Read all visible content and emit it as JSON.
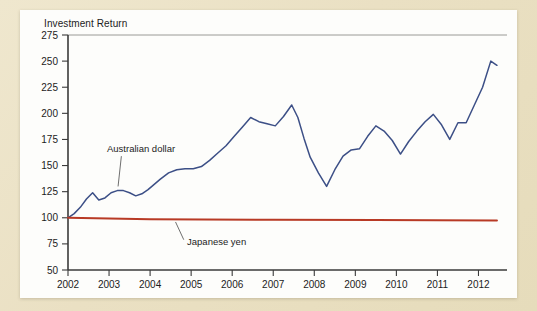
{
  "chart_data": {
    "type": "line",
    "title": "Investment Return",
    "xlabel": "",
    "ylabel": "",
    "xlim": [
      2002,
      2012.5
    ],
    "ylim": [
      50,
      275
    ],
    "grid": false,
    "legend_position": "inline-annotations",
    "y_ticks": [
      275,
      250,
      225,
      200,
      175,
      150,
      125,
      100,
      75,
      50
    ],
    "x_ticks": [
      2002,
      2003,
      2004,
      2005,
      2006,
      2007,
      2008,
      2009,
      2010,
      2011,
      2012
    ],
    "annotations": [
      {
        "text": "Australian dollar",
        "x": 2002.95,
        "y": 163
      },
      {
        "text": "Japanese yen",
        "x": 2004.9,
        "y": 74
      }
    ],
    "series": [
      {
        "name": "Australian dollar",
        "color": "#3c4f86",
        "x": [
          2002.0,
          2002.15,
          2002.3,
          2002.45,
          2002.6,
          2002.75,
          2002.9,
          2003.05,
          2003.2,
          2003.35,
          2003.5,
          2003.65,
          2003.8,
          2003.95,
          2004.1,
          2004.25,
          2004.45,
          2004.65,
          2004.85,
          2005.05,
          2005.25,
          2005.45,
          2005.65,
          2005.85,
          2006.05,
          2006.25,
          2006.45,
          2006.65,
          2006.85,
          2007.05,
          2007.25,
          2007.45,
          2007.6,
          2007.75,
          2007.9,
          2008.1,
          2008.3,
          2008.5,
          2008.7,
          2008.9,
          2009.1,
          2009.3,
          2009.5,
          2009.7,
          2009.9,
          2010.1,
          2010.3,
          2010.5,
          2010.7,
          2010.9,
          2011.1,
          2011.3,
          2011.5,
          2011.7,
          2011.9,
          2012.1,
          2012.3,
          2012.45
        ],
        "y": [
          100,
          104,
          110,
          118,
          124,
          117,
          119,
          124,
          126,
          126,
          124,
          121,
          123,
          127,
          132,
          137,
          143,
          146,
          147,
          147,
          149,
          155,
          162,
          169,
          178,
          187,
          196,
          192,
          190,
          188,
          197,
          208,
          196,
          176,
          158,
          143,
          130,
          146,
          159,
          165,
          166,
          178,
          188,
          183,
          174,
          161,
          173,
          183,
          192,
          199,
          189,
          175,
          191,
          191,
          208,
          225,
          250,
          246
        ]
      },
      {
        "name": "Japanese yen",
        "color": "#b83a25",
        "x": [
          2002.0,
          2004.0,
          2007.0,
          2009.5,
          2012.45
        ],
        "y": [
          100,
          98.5,
          98.0,
          97.8,
          97.5
        ]
      }
    ]
  },
  "colors": {
    "page_background": "#ece3c8",
    "card_background": "#fdfdfb",
    "australian_dollar": "#3c4f86",
    "japanese_yen": "#b83a25",
    "axis": "#3a3a3a"
  }
}
